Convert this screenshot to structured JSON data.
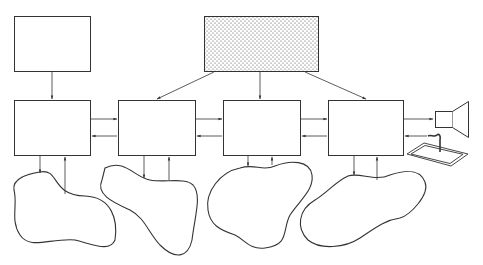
{
  "diagram": {
    "colors": {
      "stroke": "#333333",
      "background": "#ffffff",
      "stipple": "#444444"
    },
    "nodes": [
      {
        "id": "source-plain",
        "shape": "rect",
        "fill": "plain"
      },
      {
        "id": "source-stippled",
        "shape": "rect",
        "fill": "stippled"
      },
      {
        "id": "box-1",
        "shape": "rect"
      },
      {
        "id": "box-2",
        "shape": "rect"
      },
      {
        "id": "box-3",
        "shape": "rect"
      },
      {
        "id": "box-4",
        "shape": "rect"
      },
      {
        "id": "blob-1",
        "shape": "blob"
      },
      {
        "id": "blob-2",
        "shape": "blob"
      },
      {
        "id": "blob-3",
        "shape": "blob"
      },
      {
        "id": "blob-4",
        "shape": "blob"
      },
      {
        "id": "speaker",
        "shape": "loudspeaker-icon"
      },
      {
        "id": "tablet",
        "shape": "tablet-icon"
      }
    ],
    "edges": [
      {
        "from": "source-plain",
        "to": "box-1"
      },
      {
        "from": "source-stippled",
        "to": "box-2"
      },
      {
        "from": "source-stippled",
        "to": "box-3"
      },
      {
        "from": "source-stippled",
        "to": "box-4"
      },
      {
        "from": "box-1",
        "to": "box-2"
      },
      {
        "from": "box-2",
        "to": "box-1"
      },
      {
        "from": "box-2",
        "to": "box-3"
      },
      {
        "from": "box-3",
        "to": "box-2"
      },
      {
        "from": "box-3",
        "to": "box-4"
      },
      {
        "from": "box-4",
        "to": "box-3"
      },
      {
        "from": "box-4",
        "to": "speaker"
      },
      {
        "from": "tablet",
        "to": "box-4"
      },
      {
        "from": "box-1",
        "to": "blob-1"
      },
      {
        "from": "blob-1",
        "to": "box-1"
      },
      {
        "from": "box-2",
        "to": "blob-2"
      },
      {
        "from": "blob-2",
        "to": "box-2"
      },
      {
        "from": "box-3",
        "to": "blob-3"
      },
      {
        "from": "blob-3",
        "to": "box-3"
      },
      {
        "from": "box-4",
        "to": "blob-4"
      },
      {
        "from": "blob-4",
        "to": "box-4"
      }
    ]
  }
}
